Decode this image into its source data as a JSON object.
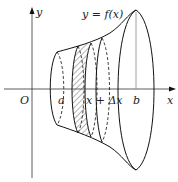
{
  "figure": {
    "labels": {
      "y_axis": "y",
      "x_axis": "x",
      "origin": "O",
      "a": "a",
      "slice": "x + Δx",
      "slice_x": "x",
      "b": "b",
      "curve": "y = f(x)"
    },
    "colors": {
      "stroke": "#111111",
      "axis": "#333333",
      "hatch": "#444444",
      "background": "#ffffff"
    }
  }
}
